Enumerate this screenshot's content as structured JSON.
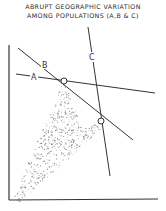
{
  "title": {
    "line1": "ABRUPT  GEOGRAPHIC VARIATION",
    "line2": "AMONG  POPULATIONS (A,B & C)"
  },
  "lines": [
    {
      "id": "A",
      "label": "A"
    },
    {
      "id": "B",
      "label": "B"
    },
    {
      "id": "C",
      "label": "C"
    }
  ],
  "colors": {
    "ink": "#333333",
    "stipple": "#8a8a8a",
    "background": "#ffffff"
  }
}
